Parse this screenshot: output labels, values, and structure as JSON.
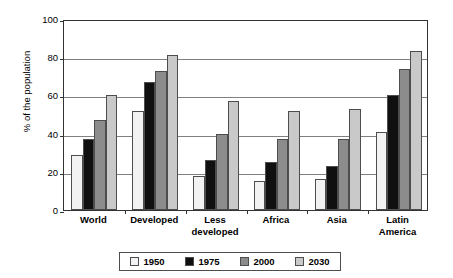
{
  "chart_data": {
    "type": "bar",
    "title": "",
    "xlabel": "",
    "ylabel": "% of the population",
    "ylim": [
      0,
      100
    ],
    "ytick_step": 20,
    "yticks": [
      0,
      20,
      40,
      60,
      80,
      100
    ],
    "ytick_labels": [
      "0",
      "20",
      "40",
      "60",
      "80",
      "100"
    ],
    "grid": true,
    "legend_position": "bottom",
    "categories": [
      "World",
      "Developed",
      "Less developed",
      "Africa",
      "Asia",
      "Latin America"
    ],
    "category_lines": [
      [
        "World"
      ],
      [
        "Developed"
      ],
      [
        "Less",
        "developed"
      ],
      [
        "Africa"
      ],
      [
        "Asia"
      ],
      [
        "Latin",
        "America"
      ]
    ],
    "series": [
      {
        "name": "1950",
        "color": "#f2f2f2",
        "values": [
          29,
          52,
          18,
          15,
          16,
          41
        ]
      },
      {
        "name": "1975",
        "color": "#101010",
        "values": [
          37,
          67,
          26,
          25,
          23,
          60
        ]
      },
      {
        "name": "2000",
        "color": "#8c8c8c",
        "values": [
          47,
          73,
          40,
          37,
          37,
          74
        ]
      },
      {
        "name": "2030",
        "color": "#c9c9c9",
        "values": [
          60,
          81,
          57,
          52,
          53,
          83
        ]
      }
    ]
  },
  "style": {
    "axis_color": "#333333",
    "gridline_color": "#808080",
    "bar_outline_color": "#4d4d4d",
    "background": "#ffffff"
  }
}
